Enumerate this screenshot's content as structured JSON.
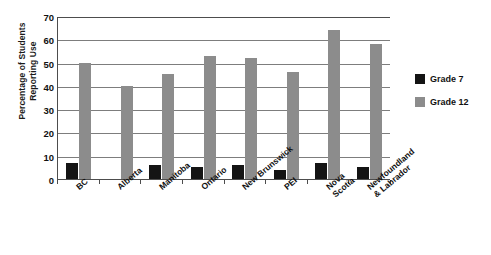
{
  "chart_data": {
    "type": "bar",
    "title": "",
    "xlabel": "",
    "ylabel": "Percentage of Students Reporting Use",
    "ylabel_lines": [
      "Percentage of Students",
      "Reporting Use"
    ],
    "ylim": [
      0,
      70
    ],
    "ytick_step": 10,
    "yticks": [
      0,
      10,
      20,
      30,
      40,
      50,
      60,
      70
    ],
    "grid": true,
    "legend_position": "right",
    "categories": [
      "BC",
      "Alberta",
      "Manitoba",
      "Ontario",
      "New Brunswick",
      "PEI",
      "Nova Scotia",
      "Newfoundland & Labrador"
    ],
    "category_lines": [
      [
        "BC"
      ],
      [
        "Alberta"
      ],
      [
        "Manitoba"
      ],
      [
        "Ontario"
      ],
      [
        "New Brunswick"
      ],
      [
        "PEI"
      ],
      [
        "Nova",
        "Scotia"
      ],
      [
        "Newfoundland",
        "& Labrador"
      ]
    ],
    "series": [
      {
        "name": "Grade 7",
        "color": "#141414",
        "values": [
          7,
          0,
          6,
          5,
          6,
          4,
          7,
          5
        ]
      },
      {
        "name": "Grade 12",
        "color": "#8c8c8c",
        "values": [
          50,
          40,
          45,
          53,
          52,
          46,
          64,
          58
        ]
      }
    ]
  },
  "legend": {
    "items": [
      {
        "label": "Grade 7",
        "color": "#141414"
      },
      {
        "label": "Grade 12",
        "color": "#8c8c8c"
      }
    ]
  }
}
